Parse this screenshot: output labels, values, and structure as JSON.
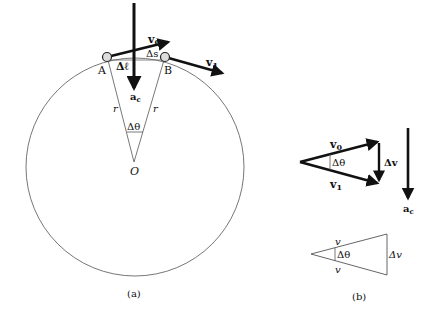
{
  "figure_a": {
    "caption": "(a)",
    "points": {
      "A": "A",
      "B": "B",
      "O": "O"
    },
    "labels": {
      "v0": "v",
      "v0_sub": "0",
      "v1": "v",
      "v1_sub": "1",
      "ac": "a",
      "ac_sub": "c",
      "delta_l": "Δℓ",
      "delta_s": "Δs",
      "r_left": "r",
      "r_right": "r",
      "delta_theta": "Δθ"
    }
  },
  "figure_b": {
    "caption": "(b)",
    "vector_triangle": {
      "v0": "v",
      "v0_sub": "0",
      "v1": "v",
      "v1_sub": "1",
      "delta_v": "Δv",
      "delta_theta": "Δθ",
      "ac": "a",
      "ac_sub": "c"
    },
    "scalar_triangle": {
      "v_top": "v",
      "v_bottom": "v",
      "delta_theta": "Δθ",
      "delta_v": "Δv"
    }
  },
  "colors": {
    "ink": "#111111",
    "line": "#555555"
  }
}
